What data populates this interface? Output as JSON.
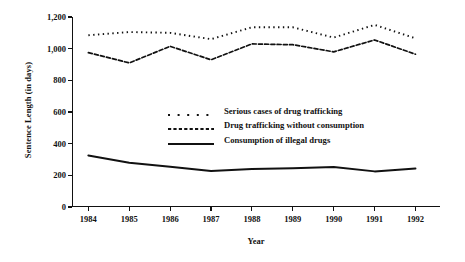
{
  "chart_data": {
    "type": "line",
    "title": "",
    "xlabel": "Year",
    "ylabel": "Sentence Length (in days)",
    "categories": [
      "1984",
      "1985",
      "1986",
      "1987",
      "1988",
      "1989",
      "1990",
      "1991",
      "1992"
    ],
    "x": [
      1984,
      1985,
      1986,
      1987,
      1988,
      1989,
      1990,
      1991,
      1992
    ],
    "xlim": [
      1983.6,
      1992.6
    ],
    "ylim": [
      0,
      1200
    ],
    "yticks": [
      0,
      200,
      400,
      600,
      800,
      1000,
      1200
    ],
    "ytick_labels": [
      "0",
      "200",
      "400",
      "600",
      "800",
      "1,000",
      "1,200"
    ],
    "grid": false,
    "legend_position": "center-left-inside",
    "series": [
      {
        "name": "Serious cases of drug trafficking",
        "style": "dotted",
        "values": [
          1085,
          1105,
          1100,
          1060,
          1135,
          1135,
          1070,
          1150,
          1065
        ]
      },
      {
        "name": "Drug trafficking without consumption",
        "style": "dashed",
        "values": [
          975,
          910,
          1015,
          930,
          1030,
          1025,
          980,
          1055,
          965
        ]
      },
      {
        "name": "Consumption of illegal drugs",
        "style": "solid",
        "values": [
          325,
          280,
          255,
          228,
          240,
          245,
          252,
          225,
          243
        ]
      }
    ]
  },
  "legend": {
    "items": [
      {
        "label": "Serious cases of drug trafficking",
        "style": "dotted"
      },
      {
        "label": "Drug trafficking without consumption",
        "style": "dashed"
      },
      {
        "label": "Consumption of illegal drugs",
        "style": "solid"
      }
    ]
  }
}
